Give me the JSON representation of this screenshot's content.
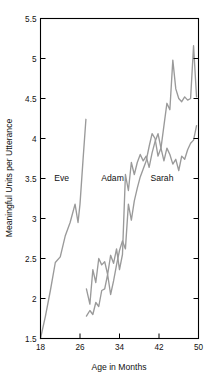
{
  "chart_data": {
    "type": "line",
    "title": "",
    "subtitle": "",
    "xlabel": "Age in Months",
    "ylabel": "Meaningful Units per Utterance",
    "xlim": [
      18,
      50
    ],
    "ylim": [
      1.5,
      5.5
    ],
    "xticks": [
      18,
      26,
      34,
      42,
      50
    ],
    "xticklabels": [
      "18",
      "26",
      "34",
      "42",
      "50"
    ],
    "yticks": [
      1.5,
      2,
      2.5,
      3,
      3.5,
      4,
      4.5,
      5,
      5.5
    ],
    "yticklabels": [
      "1.5",
      "2",
      "2.5",
      "3",
      "3.5",
      "4",
      "4.5",
      "5",
      "5.5"
    ],
    "grid": false,
    "legend": "inline-annotations",
    "line_color": "#9a9a9a",
    "frame_color": "#000000",
    "background": "#ffffff",
    "annotations": [
      {
        "text": "Eve",
        "x": 22.3,
        "y": 3.47
      },
      {
        "text": "Adam",
        "x": 32.6,
        "y": 3.47
      },
      {
        "text": "Sarah",
        "x": 42.6,
        "y": 3.47
      }
    ],
    "series": [
      {
        "name": "Eve",
        "color": "#9a9a9a",
        "x": [
          18,
          19,
          20,
          21,
          22,
          23,
          24,
          25,
          25.6,
          26,
          26.6,
          27.2
        ],
        "values": [
          1.5,
          1.78,
          2.1,
          2.45,
          2.52,
          2.78,
          2.95,
          3.18,
          2.95,
          3.18,
          3.72,
          4.24
        ]
      },
      {
        "name": "Adam",
        "color": "#9a9a9a",
        "x": [
          27.3,
          28,
          28.6,
          29.2,
          29.8,
          30.4,
          31,
          31.6,
          32.2,
          32.8,
          33.4,
          34,
          34.6,
          35.2,
          35.8,
          36.4,
          37,
          37.6,
          38.2,
          38.8,
          39.4,
          40,
          40.6,
          41.2,
          41.8,
          42.4,
          43,
          43.6,
          44.2,
          44.8,
          45.4,
          46,
          46.6,
          47.2,
          47.8,
          48.4,
          49,
          49.6
        ],
        "values": [
          2.12,
          1.93,
          2.36,
          2.2,
          2.5,
          2.42,
          2.46,
          2.3,
          2.54,
          2.44,
          2.62,
          2.36,
          2.55,
          3.55,
          3.35,
          3.7,
          3.55,
          3.7,
          3.8,
          3.72,
          3.78,
          3.64,
          3.82,
          3.96,
          4.06,
          3.88,
          3.72,
          3.88,
          3.8,
          3.68,
          3.74,
          3.6,
          3.78,
          3.74,
          3.86,
          3.94,
          3.98,
          4.16
        ]
      },
      {
        "name": "Sarah",
        "color": "#9a9a9a",
        "x": [
          27.3,
          28,
          28.6,
          29.2,
          29.8,
          30.4,
          31,
          31.6,
          32.2,
          32.8,
          33.4,
          34,
          34.6,
          35.2,
          35.8,
          36.4,
          37,
          37.6,
          38.2,
          38.8,
          39.4,
          40,
          40.6,
          41.2,
          41.8,
          42.4,
          43,
          43.6,
          44.2,
          44.8,
          45.4,
          46,
          46.6,
          47.2,
          47.8,
          48.4,
          49,
          49.6
        ],
        "values": [
          1.78,
          1.85,
          1.8,
          1.95,
          1.9,
          2.1,
          2.12,
          2.3,
          2.05,
          2.22,
          2.42,
          2.6,
          2.72,
          2.62,
          3.18,
          2.98,
          3.22,
          3.38,
          3.52,
          3.62,
          3.72,
          3.9,
          4.06,
          4.0,
          3.78,
          3.88,
          4.16,
          4.44,
          4.36,
          4.98,
          4.62,
          4.5,
          4.46,
          4.52,
          4.48,
          4.5,
          5.16,
          4.52
        ]
      }
    ]
  },
  "caption": {
    "ghost_text": ""
  }
}
